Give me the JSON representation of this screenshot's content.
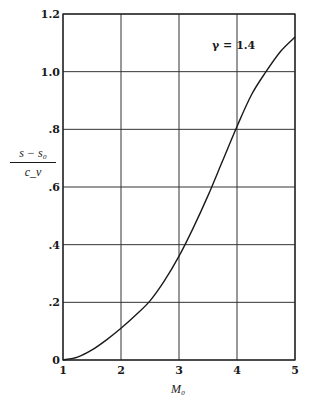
{
  "chart_data": {
    "type": "line",
    "title": "",
    "xlabel": "M₀",
    "ylabel_numerator": "s − s₀",
    "ylabel_denominator": "c_v",
    "annotation": "γ = 1.4",
    "xlim": [
      1,
      5
    ],
    "ylim": [
      0,
      1.2
    ],
    "grid": true,
    "x_ticks": [
      "1",
      "2",
      "3",
      "4",
      "5"
    ],
    "y_ticks": [
      "0",
      ".2",
      ".4",
      ".6",
      ".8",
      "1.0",
      "1.2"
    ],
    "series": [
      {
        "name": "γ = 1.4",
        "x": [
          1.0,
          1.25,
          1.5,
          1.75,
          2.0,
          2.25,
          2.5,
          2.75,
          3.0,
          3.25,
          3.5,
          3.75,
          4.0,
          4.25,
          4.5,
          4.75,
          5.0
        ],
        "y": [
          0.0,
          0.01,
          0.035,
          0.07,
          0.11,
          0.155,
          0.205,
          0.275,
          0.36,
          0.46,
          0.57,
          0.69,
          0.81,
          0.92,
          1.0,
          1.07,
          1.12
        ]
      }
    ]
  }
}
